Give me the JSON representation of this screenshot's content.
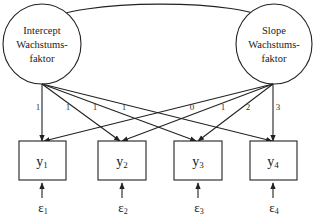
{
  "diagram": {
    "type": "latent-growth-curve-model",
    "factors": [
      {
        "id": "intercept",
        "lines": [
          "Intercept",
          "Wachstums-",
          "faktor"
        ]
      },
      {
        "id": "slope",
        "lines": [
          "Slope",
          "Wachstums-",
          "faktor"
        ]
      }
    ],
    "covariance": {
      "from": "intercept",
      "to": "slope",
      "style": "curved-double-arrow"
    },
    "indicators": [
      {
        "id": "y1",
        "base": "y",
        "sub": "1"
      },
      {
        "id": "y2",
        "base": "y",
        "sub": "2"
      },
      {
        "id": "y3",
        "base": "y",
        "sub": "3"
      },
      {
        "id": "y4",
        "base": "y",
        "sub": "4"
      }
    ],
    "errors": [
      {
        "id": "e1",
        "base": "ε",
        "sub": "1"
      },
      {
        "id": "e2",
        "base": "ε",
        "sub": "2"
      },
      {
        "id": "e3",
        "base": "ε",
        "sub": "3"
      },
      {
        "id": "e4",
        "base": "ε",
        "sub": "4"
      }
    ],
    "loadings": {
      "intercept": [
        "1",
        "1",
        "1",
        "1"
      ],
      "slope": [
        "0",
        "1",
        "2",
        "3"
      ]
    },
    "colors": {
      "stroke": "#222222",
      "background": "#ffffff"
    }
  }
}
